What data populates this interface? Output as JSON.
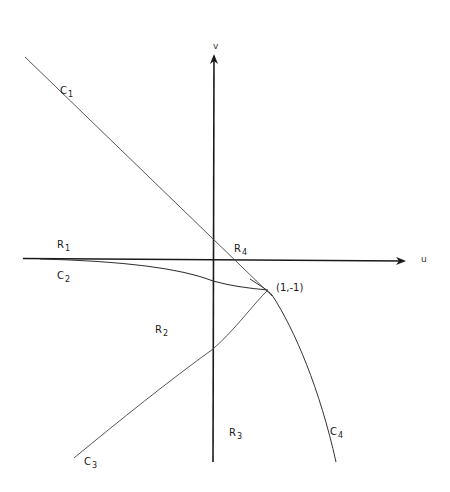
{
  "figure": {
    "axes": {
      "u_label": "u",
      "v_label": "v",
      "origin_px": [
        213,
        259
      ]
    },
    "point": {
      "label": "(1,-1)",
      "px": [
        268,
        290
      ]
    },
    "curves": [
      {
        "id": "C1",
        "letter": "C",
        "sub": "1",
        "description": "straight line through origin, tangent at (1,-1)"
      },
      {
        "id": "C2",
        "letter": "C",
        "sub": "2",
        "description": "curve from left along u-axis bending down to (1,-1)"
      },
      {
        "id": "C3",
        "letter": "C",
        "sub": "3",
        "description": "curve from lower-left rising to (1,-1)"
      },
      {
        "id": "C4",
        "letter": "C",
        "sub": "4",
        "description": "curve from (1,-1) bending down to lower right"
      }
    ],
    "regions": [
      {
        "id": "R1",
        "letter": "R",
        "sub": "1"
      },
      {
        "id": "R2",
        "letter": "R",
        "sub": "2"
      },
      {
        "id": "R3",
        "letter": "R",
        "sub": "3"
      },
      {
        "id": "R4",
        "letter": "R",
        "sub": "4"
      }
    ],
    "colors": {
      "ink": "#1a1a1a",
      "thin_line": "#444444",
      "background": "#ffffff"
    }
  }
}
